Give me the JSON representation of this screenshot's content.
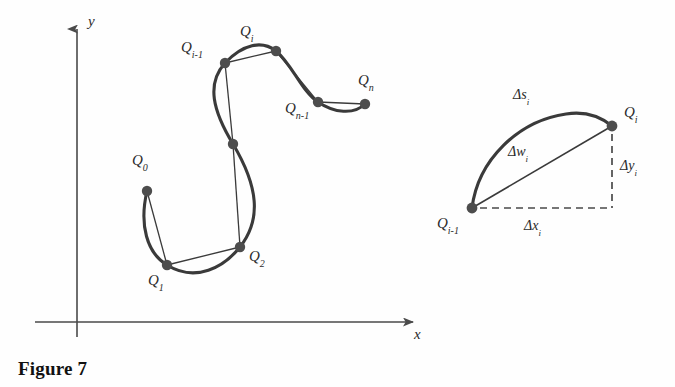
{
  "figure": {
    "caption": "Figure 7",
    "background_color": "#fefefe",
    "ink_color": "#3a3a3a",
    "axis_color": "#4a4a4a",
    "point_color": "#4d4d4d",
    "label_color": "#2b2b2b"
  },
  "axes": {
    "y_label": "y",
    "x_label": "x",
    "origin": {
      "x": 77,
      "y": 322
    },
    "x_axis": {
      "start_x": 35,
      "end_x": 420,
      "y": 322,
      "arrow": "right"
    },
    "y_axis": {
      "x": 77,
      "start_y": 337,
      "end_y": 18,
      "arrow": "up"
    }
  },
  "main_curve": {
    "description": "Smooth S-shaped parametric curve with inscribed polygonal chords joining sample points",
    "points": [
      {
        "id": "Q0",
        "base": "Q",
        "sub": "0",
        "x": 147,
        "y": 191,
        "label_x": 132,
        "label_y": 152,
        "labeled": true
      },
      {
        "id": "Q1",
        "base": "Q",
        "sub": "1",
        "x": 167,
        "y": 265,
        "label_x": 148,
        "label_y": 272,
        "labeled": true
      },
      {
        "id": "Q2",
        "base": "Q",
        "sub": "2",
        "x": 240,
        "y": 247,
        "label_x": 249,
        "label_y": 248,
        "labeled": true
      },
      {
        "id": "Qmid",
        "base": "Q",
        "sub": "",
        "x": 233,
        "y": 144,
        "label_x": 0,
        "label_y": 0,
        "labeled": false
      },
      {
        "id": "Qi-1",
        "base": "Q",
        "sub": "i-1",
        "x": 225,
        "y": 63,
        "label_x": 181,
        "label_y": 39,
        "labeled": true
      },
      {
        "id": "Qi",
        "base": "Q",
        "sub": "i",
        "x": 276,
        "y": 51,
        "label_x": 240,
        "label_y": 23,
        "labeled": true
      },
      {
        "id": "Qn-1",
        "base": "Q",
        "sub": "n-1",
        "x": 318,
        "y": 102,
        "label_x": 285,
        "label_y": 100,
        "labeled": true
      },
      {
        "id": "Qn",
        "base": "Q",
        "sub": "n",
        "x": 365,
        "y": 104,
        "label_x": 358,
        "label_y": 72,
        "labeled": true
      }
    ]
  },
  "detail_triangle": {
    "description": "Enlarged detail of one subdivision showing arc length, chord, and coordinate increments",
    "start_point": {
      "id": "Qi-1",
      "base": "Q",
      "sub": "i-1",
      "x": 472,
      "y": 208,
      "label_x": 437,
      "label_y": 215
    },
    "end_point": {
      "id": "Qi",
      "base": "Q",
      "sub": "i",
      "x": 612,
      "y": 126,
      "label_x": 624,
      "label_y": 104
    },
    "corner": {
      "x": 612,
      "y": 208
    },
    "labels": [
      {
        "id": "arc",
        "base": "Δs",
        "sub": "i",
        "x": 513,
        "y": 86,
        "name": "delta-s-label"
      },
      {
        "id": "chord",
        "base": "Δw",
        "sub": "i",
        "x": 508,
        "y": 143,
        "name": "delta-w-label"
      },
      {
        "id": "dx",
        "base": "Δx",
        "sub": "i",
        "x": 524,
        "y": 217,
        "name": "delta-x-label"
      },
      {
        "id": "dy",
        "base": "Δy",
        "sub": "i",
        "x": 620,
        "y": 157,
        "name": "delta-y-label"
      }
    ]
  }
}
